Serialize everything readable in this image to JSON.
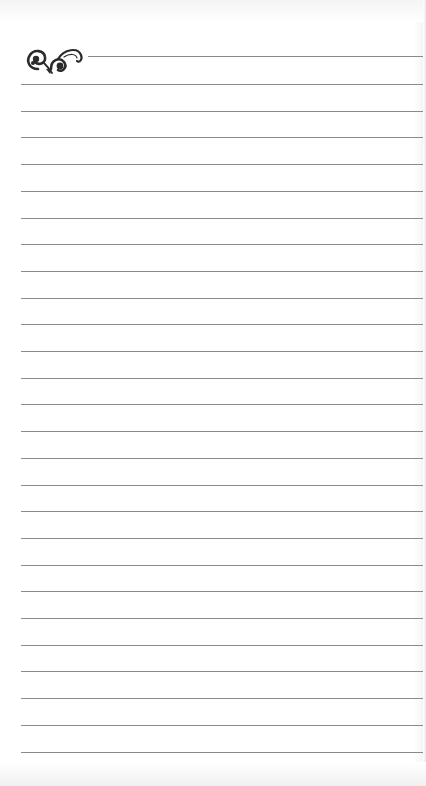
{
  "document": {
    "type": "lined notepaper page",
    "ornament_icon": "flourish-scroll-icon",
    "line_count": 26,
    "first_line_y": 84,
    "line_spacing": 26.7,
    "colors": {
      "paper": "#ffffff",
      "rule": "#8a8a8a",
      "ornament": "#2b2b2b"
    }
  }
}
